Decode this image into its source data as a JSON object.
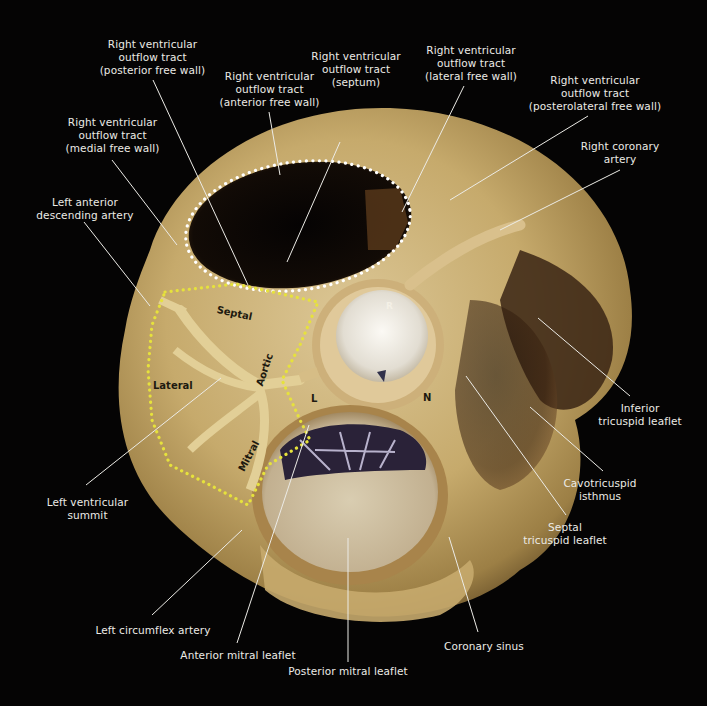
{
  "figure": {
    "background": "#050404",
    "colors": {
      "tissue_light": "#d8c08a",
      "tissue_mid": "#b99a5c",
      "tissue_dark": "#6e5530",
      "cavity": "#0a0705",
      "valve_white": "#eeeae2",
      "rvot_outline": "#ffffff",
      "lv_summit_outline": "#e4e03a",
      "leader_line": "#ecebe6"
    }
  },
  "labels": [
    {
      "id": "rvot-posterior",
      "text": "Right ventricular\noutflow tract\n(posterior free wall)",
      "x": 95,
      "y": 38,
      "w": 115
    },
    {
      "id": "rvot-anterior",
      "text": "Right ventricular\noutflow tract\n(anterior free wall)",
      "x": 212,
      "y": 70,
      "w": 115
    },
    {
      "id": "rvot-septum",
      "text": "Right ventricular\noutflow tract\n(septum)",
      "x": 306,
      "y": 50,
      "w": 100
    },
    {
      "id": "rvot-lateral",
      "text": "Right ventricular\noutflow tract\n(lateral free wall)",
      "x": 416,
      "y": 44,
      "w": 110
    },
    {
      "id": "rvot-posterolateral",
      "text": "Right ventricular\noutflow tract\n(posterolateral free wall)",
      "x": 520,
      "y": 74,
      "w": 150
    },
    {
      "id": "rvot-medial",
      "text": "Right ventricular\noutflow tract\n(medial free wall)",
      "x": 55,
      "y": 116,
      "w": 115
    },
    {
      "id": "right-coronary-artery",
      "text": "Right coronary\nartery",
      "x": 570,
      "y": 140,
      "w": 100
    },
    {
      "id": "lad",
      "text": "Left anterior\ndescending artery",
      "x": 30,
      "y": 196,
      "w": 110
    },
    {
      "id": "inferior-tricuspid-leaflet",
      "text": "Inferior\ntricuspid leaflet",
      "x": 590,
      "y": 402,
      "w": 100
    },
    {
      "id": "cavotricuspid-isthmus",
      "text": "Cavotricuspid\nisthmus",
      "x": 555,
      "y": 477,
      "w": 90
    },
    {
      "id": "septal-tricuspid-leaflet",
      "text": "Septal\ntricuspid leaflet",
      "x": 515,
      "y": 521,
      "w": 100
    },
    {
      "id": "lv-summit",
      "text": "Left ventricular\nsummit",
      "x": 40,
      "y": 496,
      "w": 95
    },
    {
      "id": "left-circumflex-artery",
      "text": "Left circumflex artery",
      "x": 88,
      "y": 624,
      "w": 130
    },
    {
      "id": "anterior-mitral-leaflet",
      "text": "Anterior mitral leaflet",
      "x": 173,
      "y": 649,
      "w": 130
    },
    {
      "id": "coronary-sinus",
      "text": "Coronary sinus",
      "x": 434,
      "y": 640,
      "w": 100
    },
    {
      "id": "posterior-mitral-leaflet",
      "text": "Posterior mitral leaflet",
      "x": 278,
      "y": 665,
      "w": 140
    }
  ],
  "leaders": [
    {
      "id": "rvot-posterior",
      "x1": 153,
      "y1": 80,
      "x2": 248,
      "y2": 285
    },
    {
      "id": "rvot-anterior",
      "x1": 269,
      "y1": 112,
      "x2": 280,
      "y2": 175
    },
    {
      "id": "rvot-septum",
      "x1": 340,
      "y1": 142,
      "x2": 287,
      "y2": 262
    },
    {
      "id": "rvot-lateral",
      "x1": 464,
      "y1": 86,
      "x2": 402,
      "y2": 212
    },
    {
      "id": "rvot-posterolateral",
      "x1": 588,
      "y1": 116,
      "x2": 450,
      "y2": 200
    },
    {
      "id": "rvot-medial",
      "x1": 112,
      "y1": 160,
      "x2": 177,
      "y2": 245
    },
    {
      "id": "right-coronary-artery",
      "x1": 620,
      "y1": 170,
      "x2": 500,
      "y2": 230
    },
    {
      "id": "lad",
      "x1": 84,
      "y1": 222,
      "x2": 150,
      "y2": 306
    },
    {
      "id": "inferior-tricuspid-leaflet",
      "x1": 630,
      "y1": 396,
      "x2": 538,
      "y2": 318
    },
    {
      "id": "cavotricuspid-isthmus",
      "x1": 603,
      "y1": 471,
      "x2": 530,
      "y2": 407
    },
    {
      "id": "septal-tricuspid-leaflet",
      "x1": 566,
      "y1": 515,
      "x2": 466,
      "y2": 376
    },
    {
      "id": "lv-summit",
      "x1": 86,
      "y1": 485,
      "x2": 221,
      "y2": 378
    },
    {
      "id": "left-circumflex-artery",
      "x1": 152,
      "y1": 615,
      "x2": 242,
      "y2": 530
    },
    {
      "id": "anterior-mitral-leaflet",
      "x1": 237,
      "y1": 643,
      "x2": 309,
      "y2": 425
    },
    {
      "id": "coronary-sinus",
      "x1": 478,
      "y1": 632,
      "x2": 449,
      "y2": 537
    },
    {
      "id": "posterior-mitral-leaflet",
      "x1": 348,
      "y1": 662,
      "x2": 348,
      "y2": 538
    }
  ],
  "region_labels": [
    {
      "id": "septal",
      "text": "Septal",
      "x": 218,
      "y": 304,
      "rotate": 12,
      "style": "dark"
    },
    {
      "id": "lateral",
      "text": "Lateral",
      "x": 153,
      "y": 380,
      "rotate": 0,
      "style": "dark"
    },
    {
      "id": "aortic",
      "text": "Aortic",
      "x": 254,
      "y": 384,
      "rotate": -72,
      "style": "dark"
    },
    {
      "id": "mitral",
      "text": "Mitral",
      "x": 236,
      "y": 468,
      "rotate": -62,
      "style": "dark"
    },
    {
      "id": "cusp-r",
      "text": "R",
      "x": 386,
      "y": 301,
      "rotate": 0,
      "style": "white"
    },
    {
      "id": "cusp-l",
      "text": "L",
      "x": 311,
      "y": 393,
      "rotate": 0,
      "style": "dark"
    },
    {
      "id": "cusp-n",
      "text": "N",
      "x": 423,
      "y": 392,
      "rotate": 0,
      "style": "dark"
    }
  ]
}
